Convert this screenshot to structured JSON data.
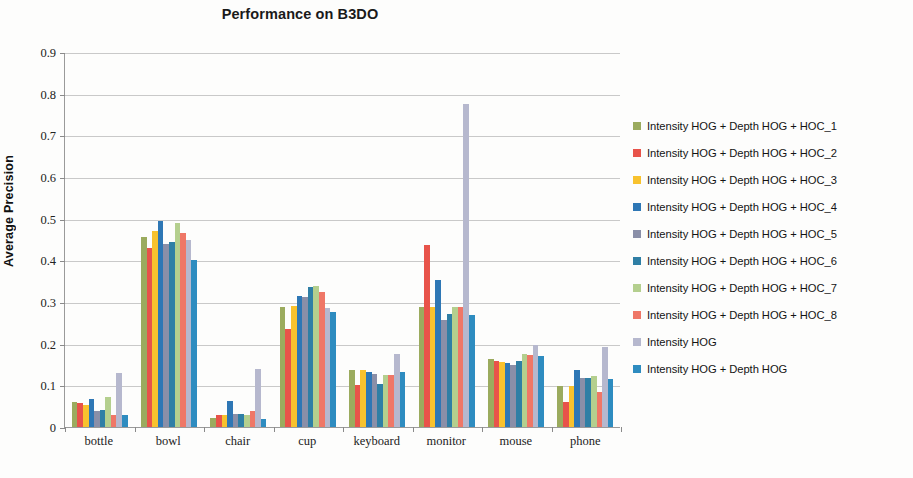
{
  "chart_data": {
    "type": "bar",
    "title": "Performance on B3DO",
    "xlabel": "",
    "ylabel": "Average Precision",
    "ylim": [
      0,
      0.9
    ],
    "ytick_labels": [
      "0.9",
      "0.8",
      "0.7",
      "0.6",
      "0.5",
      "0.4",
      "0.3",
      "0.2",
      "0.1",
      "0"
    ],
    "ytick_values": [
      0.9,
      0.8,
      0.7,
      0.6,
      0.5,
      0.4,
      0.3,
      0.2,
      0.1,
      0
    ],
    "grid": true,
    "legend_position": "right",
    "categories": [
      "bottle",
      "bowl",
      "chair",
      "cup",
      "keyboard",
      "monitor",
      "mouse",
      "phone"
    ],
    "series": [
      {
        "name": "Intensity HOG + Depth HOG + HOC_1",
        "color": "#9bab5e",
        "values": [
          0.06,
          0.455,
          0.022,
          0.288,
          0.138,
          0.288,
          0.163,
          0.098
        ]
      },
      {
        "name": "Intensity HOG + Depth HOG + HOC_2",
        "color": "#e8534a",
        "values": [
          0.058,
          0.43,
          0.028,
          0.235,
          0.102,
          0.437,
          0.158,
          0.06
        ]
      },
      {
        "name": "Intensity HOG + Depth HOG + HOC_3",
        "color": "#f8c22e",
        "values": [
          0.052,
          0.47,
          0.03,
          0.29,
          0.138,
          0.288,
          0.157,
          0.098
        ]
      },
      {
        "name": "Intensity HOG + Depth HOG + HOC_4",
        "color": "#2e77b5",
        "values": [
          0.068,
          0.495,
          0.062,
          0.315,
          0.132,
          0.352,
          0.153,
          0.138
        ]
      },
      {
        "name": "Intensity HOG + Depth HOG + HOC_5",
        "color": "#8a8fa8",
        "values": [
          0.038,
          0.44,
          0.032,
          0.312,
          0.128,
          0.258,
          0.15,
          0.118
        ]
      },
      {
        "name": "Intensity HOG + Depth HOG + HOC_6",
        "color": "#2f7fa5",
        "values": [
          0.04,
          0.445,
          0.032,
          0.335,
          0.103,
          0.272,
          0.158,
          0.118
        ]
      },
      {
        "name": "Intensity HOG + Depth HOG + HOC_7",
        "color": "#b4cf8e",
        "values": [
          0.072,
          0.49,
          0.03,
          0.338,
          0.125,
          0.288,
          0.175,
          0.122
        ]
      },
      {
        "name": "Intensity HOG + Depth HOG + HOC_8",
        "color": "#ef7767",
        "values": [
          0.03,
          0.465,
          0.038,
          0.325,
          0.125,
          0.288,
          0.172,
          0.085
        ]
      },
      {
        "name": "Intensity HOG",
        "color": "#b6b8ce",
        "values": [
          0.13,
          0.45,
          0.14,
          0.285,
          0.175,
          0.775,
          0.197,
          0.192
        ]
      },
      {
        "name": "Intensity HOG + Depth HOG",
        "color": "#2e8cc0",
        "values": [
          0.028,
          0.402,
          0.02,
          0.275,
          0.133,
          0.268,
          0.17,
          0.115
        ]
      }
    ]
  }
}
